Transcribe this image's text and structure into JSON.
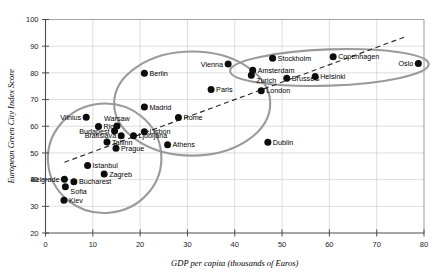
{
  "chart_data": {
    "type": "scatter",
    "title": "",
    "xlabel": "GDP per capita (thousands of Euros)",
    "ylabel": "European Green City Index Score",
    "xlim": [
      0,
      80
    ],
    "ylim": [
      20,
      100
    ],
    "xticks": [
      0,
      10,
      20,
      30,
      40,
      50,
      60,
      70,
      80
    ],
    "yticks": [
      20,
      30,
      40,
      50,
      60,
      70,
      80,
      90,
      100
    ],
    "grid": true,
    "legend": "none",
    "points": [
      {
        "label": "Vilnius",
        "x": 8.6,
        "y": 63.4,
        "label_pos": "left"
      },
      {
        "label": "Riga",
        "x": 11.2,
        "y": 59.9,
        "label_pos": "right"
      },
      {
        "label": "Budapest",
        "x": 14.6,
        "y": 58.2,
        "label_pos": "left"
      },
      {
        "label": "Bratislava",
        "x": 16.0,
        "y": 56.4,
        "label_pos": "left"
      },
      {
        "label": "Warsaw",
        "x": 15.1,
        "y": 60.1,
        "label_pos": "above"
      },
      {
        "label": "Tallinn",
        "x": 13.0,
        "y": 54.1,
        "label_pos": "right"
      },
      {
        "label": "Ljubljana",
        "x": 18.6,
        "y": 56.4,
        "label_pos": "right"
      },
      {
        "label": "Lisbon",
        "x": 20.9,
        "y": 57.9,
        "label_pos": "right"
      },
      {
        "label": "Prague",
        "x": 14.9,
        "y": 51.8,
        "label_pos": "right"
      },
      {
        "label": "Athens",
        "x": 25.8,
        "y": 53.1,
        "label_pos": "right"
      },
      {
        "label": "Istanbul",
        "x": 8.9,
        "y": 45.3,
        "label_pos": "right"
      },
      {
        "label": "Zagreb",
        "x": 12.4,
        "y": 42.1,
        "label_pos": "right"
      },
      {
        "label": "Belgrade",
        "x": 4.0,
        "y": 40.1,
        "label_pos": "left"
      },
      {
        "label": "Bucharest",
        "x": 6.0,
        "y": 39.2,
        "label_pos": "right"
      },
      {
        "label": "Sofia",
        "x": 4.2,
        "y": 37.3,
        "label_pos": "below"
      },
      {
        "label": "Kiev",
        "x": 3.9,
        "y": 32.3,
        "label_pos": "right"
      },
      {
        "label": "Berlin",
        "x": 20.9,
        "y": 79.9,
        "label_pos": "right"
      },
      {
        "label": "Madrid",
        "x": 20.9,
        "y": 67.2,
        "label_pos": "right"
      },
      {
        "label": "Rome",
        "x": 28.1,
        "y": 63.3,
        "label_pos": "right"
      },
      {
        "label": "Vienna",
        "x": 38.6,
        "y": 83.3,
        "label_pos": "left"
      },
      {
        "label": "Paris",
        "x": 35.0,
        "y": 73.8,
        "label_pos": "right"
      },
      {
        "label": "Zurich",
        "x": 43.5,
        "y": 79.1,
        "label_pos": "below"
      },
      {
        "label": "Amsterdam",
        "x": 43.8,
        "y": 81.0,
        "label_pos": "right"
      },
      {
        "label": "Stockholm",
        "x": 48.0,
        "y": 85.5,
        "label_pos": "right"
      },
      {
        "label": "Copenhagen",
        "x": 60.8,
        "y": 86.0,
        "label_pos": "right"
      },
      {
        "label": "Oslo",
        "x": 78.8,
        "y": 83.5,
        "label_pos": "left"
      },
      {
        "label": "Helsinki",
        "x": 57.0,
        "y": 78.6,
        "label_pos": "right"
      },
      {
        "label": "Brussels",
        "x": 51.0,
        "y": 78.0,
        "label_pos": "right"
      },
      {
        "label": "London",
        "x": 45.6,
        "y": 73.3,
        "label_pos": "right"
      },
      {
        "label": "Dublin",
        "x": 47.0,
        "y": 54.0,
        "label_pos": "right"
      }
    ],
    "trend_line": {
      "style": "dashed",
      "x0": 4.0,
      "y0": 46.5,
      "x1": 76.0,
      "y1": 93.5
    },
    "clusters": [
      {
        "name": "eastern-europe-cluster",
        "cx": 12.5,
        "cy": 48.0,
        "rx": 12.0,
        "ry": 20.5,
        "rotation": -5
      },
      {
        "name": "western-europe-cluster",
        "cx": 31.0,
        "cy": 68.5,
        "rx": 16.5,
        "ry": 19.5,
        "rotation": 0
      },
      {
        "name": "nordic-cluster",
        "cx": 60.0,
        "cy": 82.0,
        "rx": 21.0,
        "ry": 6.8,
        "rotation": -2
      }
    ],
    "colors": {
      "marker": "#0d0d0d",
      "gridline": "#c8c8c8",
      "axis": "#4d4d4d",
      "cluster_outline": "#9a9a9a",
      "trend_line": "#2b2b2b"
    }
  }
}
